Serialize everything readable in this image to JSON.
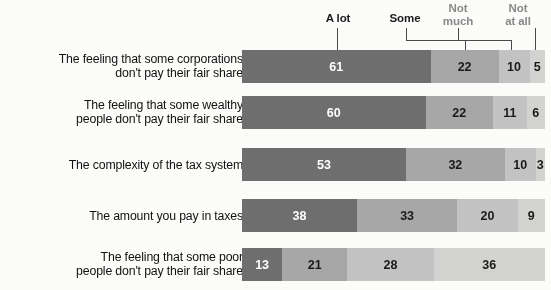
{
  "chart_data": {
    "type": "bar",
    "subtype": "stacked-horizontal-100",
    "title": "",
    "xlabel": "",
    "ylabel": "",
    "xlim": [
      0,
      100
    ],
    "grid": false,
    "legend_position": "top",
    "categories": [
      "The feeling that some corporations\ndon't pay their fair share",
      "The feeling that some wealthy\npeople don't pay their fair share",
      "The complexity of the tax system",
      "The amount you pay in taxes",
      "The feeling that some poor\npeople don't pay their fair share"
    ],
    "series": [
      {
        "name": "A lot",
        "color": "#6f6f6f",
        "values": [
          61,
          60,
          53,
          38,
          13
        ]
      },
      {
        "name": "Some",
        "color": "#a8a8a8",
        "values": [
          22,
          22,
          32,
          33,
          21
        ]
      },
      {
        "name": "Not much",
        "color": "#c4c4c4",
        "values": [
          10,
          11,
          10,
          20,
          28
        ]
      },
      {
        "name": "Not at all",
        "color": "#d4d4d2",
        "values": [
          5,
          6,
          3,
          9,
          36
        ]
      }
    ]
  },
  "legend": {
    "items": [
      {
        "label": "A lot",
        "tone": "dark"
      },
      {
        "label": "Some",
        "tone": "dark"
      },
      {
        "label": "Not\nmuch",
        "tone": "light"
      },
      {
        "label": "Not\nat all",
        "tone": "light"
      }
    ]
  },
  "rows": [
    {
      "label": "The feeling that some corporations\ndon't pay their fair share",
      "values": [
        61,
        22,
        10,
        5
      ]
    },
    {
      "label": "The feeling that some wealthy\npeople don't pay their fair share",
      "values": [
        60,
        22,
        11,
        6
      ]
    },
    {
      "label": "The complexity of the tax system",
      "values": [
        53,
        32,
        10,
        3
      ]
    },
    {
      "label": "The amount you pay in taxes",
      "values": [
        38,
        33,
        20,
        9
      ]
    },
    {
      "label": "The feeling that some poor\npeople don't pay their fair share",
      "values": [
        13,
        21,
        28,
        36
      ]
    }
  ]
}
